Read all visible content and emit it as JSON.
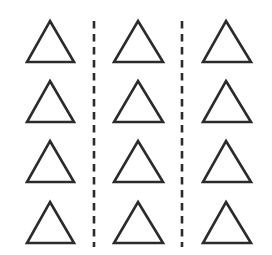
{
  "diagram": {
    "background": "#ffffff",
    "stroke_color": "#2b2b2b",
    "grid": {
      "rows": 4,
      "columns": 3
    },
    "columns": [
      {
        "center_x": 50,
        "left_x": 27,
        "right_x": 74
      },
      {
        "center_x": 138,
        "left_x": 114,
        "right_x": 163
      },
      {
        "center_x": 226,
        "left_x": 203,
        "right_x": 251
      }
    ],
    "rows": [
      {
        "apex_y": 21,
        "base_y": 62
      },
      {
        "apex_y": 81,
        "base_y": 122
      },
      {
        "apex_y": 141,
        "base_y": 182
      },
      {
        "apex_y": 202,
        "base_y": 243
      }
    ],
    "shape": "triangle-outline",
    "dividers": [
      {
        "x": 94,
        "y_start": 21,
        "y_end": 247,
        "style": "dashed"
      },
      {
        "x": 182,
        "y_start": 21,
        "y_end": 247,
        "style": "dashed"
      }
    ]
  }
}
